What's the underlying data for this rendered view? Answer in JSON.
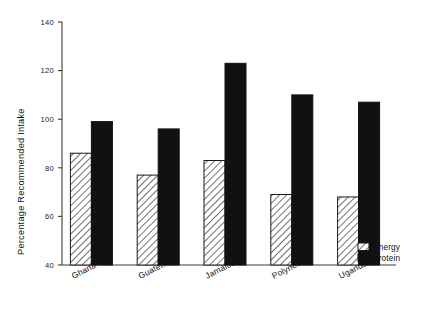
{
  "chart_data": {
    "type": "bar",
    "title": "",
    "xlabel": "",
    "ylabel": "Percentage Recommended Intake",
    "ylim": [
      40,
      140
    ],
    "yticks": [
      40,
      60,
      80,
      100,
      120,
      140
    ],
    "ytick_labels": [
      "40",
      "60",
      "80",
      "100",
      "120",
      "140"
    ],
    "grid": false,
    "legend_position": "right-bottom",
    "categories": [
      "Ghana",
      "Guatemala",
      "Jamaica",
      "Polynesia",
      "Uganda"
    ],
    "series": [
      {
        "name": "Energy",
        "values": [
          86,
          77,
          83,
          69,
          68
        ],
        "fill": "hatched",
        "color": "#ffffff"
      },
      {
        "name": "Protein",
        "values": [
          99,
          96,
          123,
          110,
          107
        ],
        "fill": "solid",
        "color": "#111111"
      }
    ]
  },
  "legend": {
    "items": [
      {
        "label": "Energy",
        "swatch": "hatched"
      },
      {
        "label": "Protein",
        "swatch": "solid"
      }
    ]
  },
  "colors": {
    "axis": "#3a3a3a",
    "text": "#111111",
    "protein_fill": "#111111",
    "energy_fill": "#ffffff",
    "hatch_stroke": "#333333"
  }
}
